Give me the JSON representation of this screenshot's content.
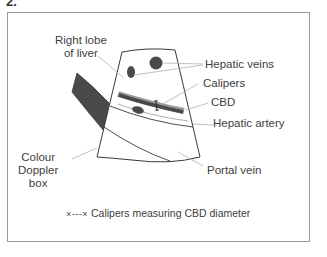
{
  "figure": {
    "heading": "2.",
    "labels": {
      "right_lobe": [
        "Right lobe",
        "of liver"
      ],
      "hepatic_veins": "Hepatic veins",
      "calipers": "Calipers",
      "cbd": "CBD",
      "hepatic_artery": "Hepatic artery",
      "colour_doppler": [
        "Colour",
        "Doppler",
        "box"
      ],
      "portal_vein": "Portal vein"
    },
    "legend": {
      "marker": "×---×",
      "text": "Calipers measuring CBD diameter"
    },
    "colors": {
      "structure_fill": "#4a4a4a",
      "outline": "#3a3a3a",
      "leader_line": "#b0b0b0",
      "frame": "#9a9a9a"
    }
  }
}
